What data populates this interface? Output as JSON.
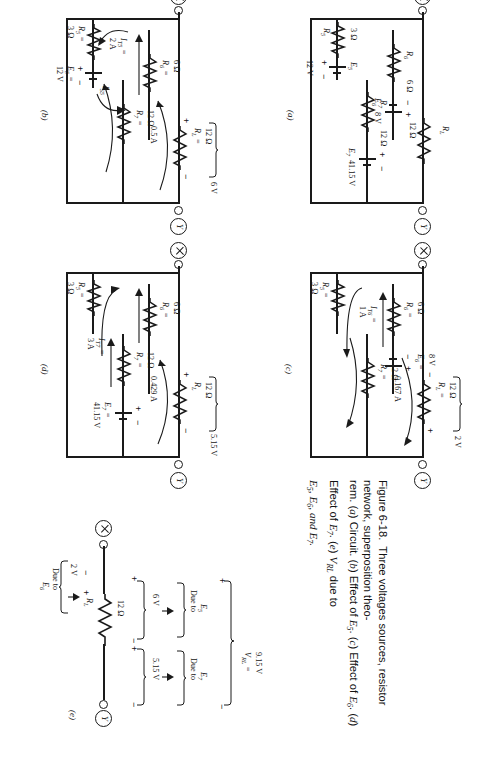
{
  "figure": {
    "caption_number": "Figure 6-18.",
    "caption_text": "Three voltages sources, resistor network, superposition theorem. (a) Circuit. (b) Effect of E5. (c) Effect of E6. (d) Effect of E7. (e) VRL due to E5, E6, and E7."
  },
  "caption_parts": {
    "label": "Figure 6-18.",
    "lead": "Three voltages sources, resistor network, superposition theo-",
    "line2_a": "rem. (",
    "line2_a_it": "a",
    "line2_b": ") Circuit. (",
    "line2_b_it": "b",
    "line2_c": ") Effect of ",
    "e5": "E",
    "sub5": "5",
    "line2_d": ". (",
    "line2_c_it": "c",
    "line2_e": ") Effect of ",
    "e6": "E",
    "sub6": "6",
    "line2_f": ". (",
    "line2_d_it": "d",
    "line2_g": ") Effect of ",
    "e7": "E",
    "sub7": "7",
    "line2_h": ". (",
    "line2_e_it": "e",
    "line2_i": ") ",
    "vrl": "V",
    "subrl": "RL",
    "line2_j": " due to",
    "line3": "E5, E6, and E7."
  },
  "terminals": {
    "x": "X",
    "y": "Y"
  },
  "units": {
    "ohm": "Ω",
    "volt": "V",
    "amp": "A"
  },
  "panel_a": {
    "id": "(a)",
    "rl_name": "R",
    "rl_sub": "L",
    "rl_val": "12 Ω",
    "r7_name": "R",
    "r7_sub": "7",
    "r7_val": "12 Ω",
    "e7_name": "E",
    "e7_sub": "7",
    "e7_val": "41.15",
    "e7_unit": "V",
    "r6_name": "R",
    "r6_sub": "6",
    "r6_val": "6 Ω",
    "e6_name": "E",
    "e6_sub": "6",
    "e6_val": "8 V",
    "r5_name": "R",
    "r5_sub": "5",
    "r5_val": "3 Ω",
    "e5_name": "E",
    "e5_sub": "5",
    "e5_val": "12 V"
  },
  "panel_b": {
    "id": "(b)",
    "rl_name": "R",
    "rl_sub": "L",
    "rl_eq": "=",
    "rl_val": "12 Ω",
    "rl_drop": "6 V",
    "rl_current": "0.5 A",
    "r7_name": "R",
    "r7_sub": "7",
    "r7_eq": "=",
    "r7_val": "12 Ω",
    "r6_name": "R",
    "r6_sub": "6",
    "r6_eq": "=",
    "r6_val": "6 Ω",
    "r5_name": "R",
    "r5_sub": "5",
    "r5_eq": "=",
    "r5_val": "3 Ω",
    "e5_name": "E",
    "e5_sub": "5",
    "e5_eq": "=",
    "e5_val": "12 V",
    "it5_name": "I",
    "it5_sub": "T5",
    "it5_eq": "=",
    "it5_val": "2 A",
    "is5_name": "I",
    "is5_sub": "S5"
  },
  "panel_c": {
    "id": "(c)",
    "rl_name": "R",
    "rl_sub": "L",
    "rl_eq": "=",
    "rl_val": "12 Ω",
    "rl_drop": "2 V",
    "rl_current": "0.167 A",
    "r7_name": "R",
    "r7_sub": "7",
    "r7_eq": "=",
    "r7_val": "12 Ω",
    "r6_name": "R",
    "r6_sub": "6",
    "r6_eq": "=",
    "r6_val": "6 Ω",
    "r5_name": "R",
    "r5_sub": "5",
    "r5_eq": "=",
    "r5_val": "3 Ω",
    "e6_name": "E",
    "e6_sub": "6",
    "e6_eq": "=",
    "e6_val": "8 V",
    "it6_name": "I",
    "it6_sub": "T6",
    "it6_eq": "=",
    "it6_val": "1 A"
  },
  "panel_d": {
    "id": "(d)",
    "rl_name": "R",
    "rl_sub": "L",
    "rl_val": "5.15",
    "rl_unit": "V",
    "rl_ohm": "12 Ω",
    "rl_current": "0.429 A",
    "r7_name": "R",
    "r7_sub": "7",
    "r7_eq": "=",
    "r7_val": "12 Ω",
    "r6_name": "R",
    "r6_sub": "6",
    "r6_eq": "=",
    "r6_val": "6 Ω",
    "r5_name": "R",
    "r5_sub": "5",
    "r5_eq": "=",
    "r5_val": "3 Ω",
    "e7_name": "E",
    "e7_sub": "7",
    "e7_eq": "=",
    "e7_val": "41.15 V",
    "it7_name": "I",
    "it7_sub": "T7",
    "it7_eq": "=",
    "it7_val": "3 A"
  },
  "panel_e": {
    "id": "(e)",
    "rl_name": "R",
    "rl_sub": "L",
    "rl_val": "12 Ω",
    "v_e6": "2 V",
    "due_e6_1": "Due to",
    "due_e6_2": "E",
    "due_e6_sub": "6",
    "v_e5": "6 V",
    "due_e5_1": "Due to",
    "due_e5_2": "E",
    "due_e5_sub": "5",
    "v_e7": "5.15 V",
    "due_e7_1": "Due to",
    "due_e7_2": "E",
    "due_e7_sub": "7",
    "vrl_name": "V",
    "vrl_sub": "RL",
    "vrl_eq": "=",
    "vrl_val": "9.15 V"
  }
}
